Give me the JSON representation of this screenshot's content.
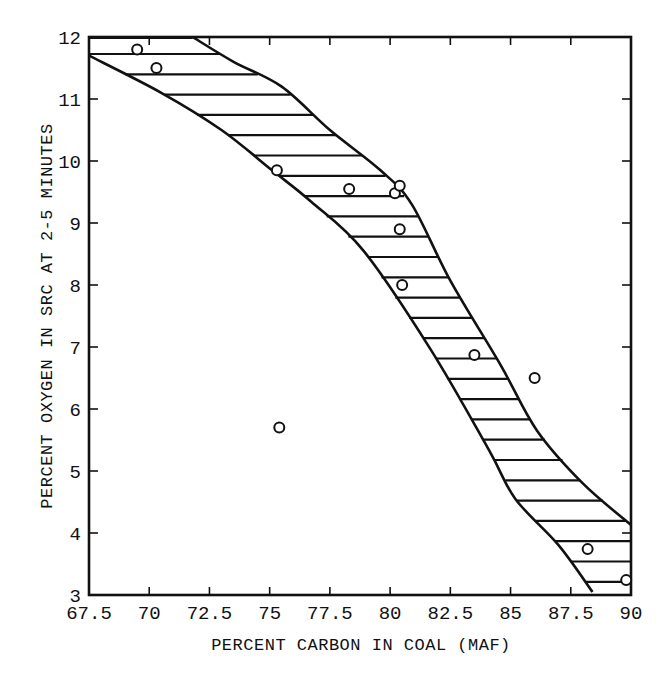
{
  "chart_data": {
    "type": "scatter",
    "title": "",
    "xlabel": "PERCENT CARBON IN COAL (MAF)",
    "ylabel": "PERCENT OXYGEN IN SRC AT 2-5 MINUTES",
    "xlim": [
      67.5,
      90
    ],
    "ylim": [
      3,
      12
    ],
    "x_ticks": [
      67.5,
      70,
      72.5,
      75,
      77.5,
      80,
      82.5,
      85,
      87.5,
      90
    ],
    "x_tick_labels": [
      "67.5",
      "70",
      "72.5",
      "75",
      "77.5",
      "80",
      "82.5",
      "85",
      "87.5",
      "90"
    ],
    "y_ticks": [
      3,
      4,
      5,
      6,
      7,
      8,
      9,
      10,
      11,
      12
    ],
    "y_tick_labels": [
      "3",
      "4",
      "5",
      "6",
      "7",
      "8",
      "9",
      "10",
      "11",
      "12"
    ],
    "grid": false,
    "legend": null,
    "series": [
      {
        "name": "Data points",
        "marker": "open-circle",
        "x": [
          69.5,
          70.3,
          75.3,
          78.3,
          80.2,
          80.4,
          80.4,
          80.5,
          83.5,
          86.0,
          75.4,
          88.2,
          89.8
        ],
        "y": [
          11.8,
          11.5,
          9.85,
          9.55,
          9.48,
          9.6,
          8.9,
          8.0,
          6.87,
          6.5,
          5.7,
          3.74,
          3.24
        ]
      }
    ],
    "band": {
      "name": "Hatched band (horizontal hatching)",
      "upper_curve": {
        "x": [
          71.8,
          73.5,
          75.5,
          77.5,
          79.6,
          80.9,
          82.5,
          84.6,
          86.1,
          88.0,
          90.0
        ],
        "y": [
          12.0,
          11.6,
          11.2,
          10.5,
          9.85,
          9.3,
          8.07,
          6.7,
          5.65,
          4.8,
          4.13
        ]
      },
      "lower_curve": {
        "x": [
          67.5,
          70.5,
          73.0,
          75.1,
          76.7,
          78.9,
          81.7,
          84.1,
          85.2,
          87.0,
          88.4
        ],
        "y": [
          11.7,
          11.1,
          10.5,
          9.85,
          9.35,
          8.55,
          6.95,
          5.34,
          4.55,
          3.8,
          3.05
        ]
      },
      "upper_flat_top": {
        "x": [
          67.5,
          71.8
        ],
        "y": [
          12.0,
          12.0
        ]
      }
    }
  }
}
